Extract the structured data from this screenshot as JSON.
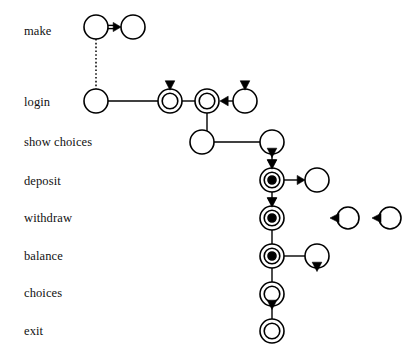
{
  "diagram": {
    "background_color": "#ffffff",
    "stroke_color": "#000000",
    "row_labels": [
      {
        "id": "make",
        "text": "make",
        "x": 24,
        "y": 34
      },
      {
        "id": "login",
        "text": "login",
        "x": 24,
        "y": 105
      },
      {
        "id": "show-choices",
        "text": "show choices",
        "x": 24,
        "y": 145
      },
      {
        "id": "deposit",
        "text": "deposit",
        "x": 24,
        "y": 184
      },
      {
        "id": "withdraw",
        "text": "withdraw",
        "x": 24,
        "y": 221
      },
      {
        "id": "balance",
        "text": "balance",
        "x": 24,
        "y": 259
      },
      {
        "id": "choices",
        "text": "choices",
        "x": 24,
        "y": 296
      },
      {
        "id": "exit",
        "text": "exit",
        "x": 24,
        "y": 334
      }
    ],
    "nodes": [
      {
        "id": "make-left",
        "row": "make",
        "x": 96,
        "y": 27,
        "r": 12,
        "style": "single",
        "filled": false,
        "marker": "none"
      },
      {
        "id": "make-right",
        "row": "make",
        "x": 133,
        "y": 27,
        "r": 12,
        "style": "single",
        "filled": false,
        "marker": "none"
      },
      {
        "id": "login-left",
        "row": "login",
        "x": 96,
        "y": 101,
        "r": 12,
        "style": "single",
        "filled": false,
        "marker": "none"
      },
      {
        "id": "login-mid",
        "row": "login",
        "x": 170,
        "y": 101,
        "r": 12,
        "style": "double",
        "filled": false,
        "marker": "top-triangle"
      },
      {
        "id": "login-right",
        "row": "login",
        "x": 207,
        "y": 101,
        "r": 12,
        "style": "double",
        "filled": false,
        "marker": "none"
      },
      {
        "id": "login-source",
        "row": "login",
        "x": 245,
        "y": 101,
        "r": 12,
        "style": "single",
        "filled": false,
        "marker": "top-triangle"
      },
      {
        "id": "choices-left",
        "row": "show-choices",
        "x": 202,
        "y": 142,
        "r": 12,
        "style": "single",
        "filled": false,
        "marker": "none"
      },
      {
        "id": "choices-right",
        "row": "show-choices",
        "x": 272,
        "y": 142,
        "r": 12,
        "style": "single",
        "filled": false,
        "marker": "bottom-triangle"
      },
      {
        "id": "deposit-main",
        "row": "deposit",
        "x": 272,
        "y": 180,
        "r": 12,
        "style": "triple",
        "filled": true,
        "marker": "top-triangle"
      },
      {
        "id": "deposit-target",
        "row": "deposit",
        "x": 317,
        "y": 180,
        "r": 12,
        "style": "single",
        "filled": false,
        "marker": "none"
      },
      {
        "id": "withdraw-main",
        "row": "withdraw",
        "x": 272,
        "y": 218,
        "r": 12,
        "style": "triple",
        "filled": true,
        "marker": "top-triangle"
      },
      {
        "id": "withdraw-extra-1",
        "row": "withdraw",
        "x": 348,
        "y": 218,
        "r": 11,
        "style": "single",
        "filled": false,
        "marker": "left-triangle"
      },
      {
        "id": "withdraw-extra-2",
        "row": "withdraw",
        "x": 390,
        "y": 218,
        "r": 11,
        "style": "single",
        "filled": false,
        "marker": "left-triangle"
      },
      {
        "id": "balance-main",
        "row": "balance",
        "x": 272,
        "y": 256,
        "r": 12,
        "style": "triple",
        "filled": true,
        "marker": "none"
      },
      {
        "id": "balance-target",
        "row": "balance",
        "x": 317,
        "y": 256,
        "r": 12,
        "style": "single",
        "filled": false,
        "marker": "bottom-triangle"
      },
      {
        "id": "choices-main",
        "row": "choices",
        "x": 272,
        "y": 294,
        "r": 12,
        "style": "double",
        "filled": false,
        "marker": "bottom-triangle"
      },
      {
        "id": "exit-main",
        "row": "exit",
        "x": 272,
        "y": 331,
        "r": 12,
        "style": "double",
        "filled": false,
        "marker": "none"
      }
    ],
    "edges": [
      {
        "id": "make-left-to-make-right",
        "from": "make-left",
        "to": "make-right",
        "kind": "double-arrow-right"
      },
      {
        "id": "make-left-to-login-left",
        "from": "make-left",
        "to": "login-left",
        "kind": "dotted-vertical"
      },
      {
        "id": "login-left-to-login-mid",
        "from": "login-left",
        "to": "login-mid",
        "kind": "plain-horizontal"
      },
      {
        "id": "login-mid-to-login-right",
        "from": "login-mid",
        "to": "login-right",
        "kind": "plain-horizontal"
      },
      {
        "id": "login-source-to-login-right",
        "from": "login-source",
        "to": "login-right",
        "kind": "arrow-left"
      },
      {
        "id": "login-right-to-choices-left",
        "from": "login-right",
        "to": "choices-left",
        "kind": "elbow-down-left"
      },
      {
        "id": "choices-left-to-choices-right",
        "from": "choices-left",
        "to": "choices-right",
        "kind": "plain-horizontal"
      },
      {
        "id": "choices-right-to-deposit",
        "from": "choices-right",
        "to": "deposit-main",
        "kind": "arrow-down"
      },
      {
        "id": "deposit-to-target",
        "from": "deposit-main",
        "to": "deposit-target",
        "kind": "arrow-right"
      },
      {
        "id": "deposit-to-withdraw",
        "from": "deposit-main",
        "to": "withdraw-main",
        "kind": "arrow-down"
      },
      {
        "id": "withdraw-to-balance",
        "from": "withdraw-main",
        "to": "balance-main",
        "kind": "plain-vertical"
      },
      {
        "id": "balance-to-target",
        "from": "balance-main",
        "to": "balance-target",
        "kind": "plain-horizontal"
      },
      {
        "id": "balance-to-choices",
        "from": "balance-main",
        "to": "choices-main",
        "kind": "plain-vertical"
      },
      {
        "id": "choices-to-exit",
        "from": "choices-main",
        "to": "exit-main",
        "kind": "plain-vertical"
      }
    ]
  }
}
